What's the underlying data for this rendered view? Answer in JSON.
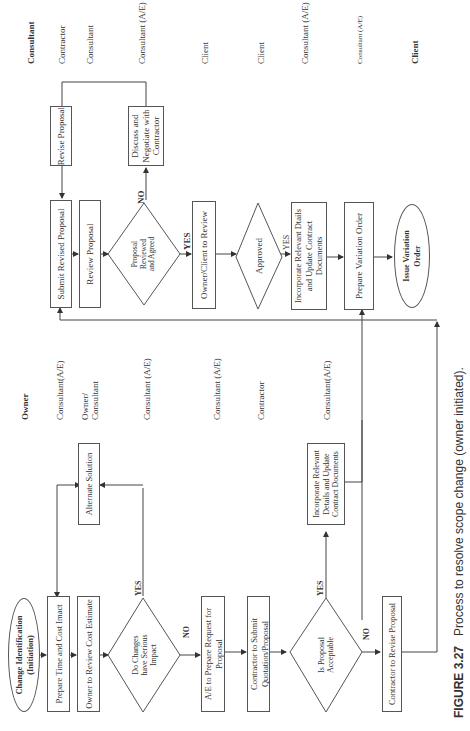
{
  "upper_flow": {
    "role_header": "Consultant",
    "roles": [
      "Contractor",
      "Consultant",
      "Consultant (A/E)",
      "Client",
      "Client",
      "Consultant (A/E)",
      "Consultant (A/E)",
      "Client"
    ],
    "steps": {
      "submit_revised": "Submit Revised Proposal",
      "revise_proposal": "Revise Proposal",
      "review_proposal": "Review Proposal",
      "decision_reviewed": [
        "Proposal",
        "Reviewed",
        "and Agreed"
      ],
      "discuss": [
        "Discuss and",
        "Negotiate with",
        "Contractor"
      ],
      "owner_review": "Owner/Client to Review",
      "approved": "Approved",
      "incorporate": [
        "Incorporate Relevant Dtails",
        "and Update Contract",
        "Documents"
      ],
      "prepare_vo": "Prepare Variation Order",
      "issue_vo": [
        "Issue Variation",
        "Order"
      ]
    },
    "labels": {
      "no": "NO",
      "yes1": "YES",
      "yes2": "YES"
    }
  },
  "lower_flow": {
    "role_header": "Owner",
    "roles": [
      "Consultant(A/E)",
      "Owner/ Consultant",
      "Consultant (A/E)",
      "Consultant (A/E)",
      "Contractor",
      "Consultant(A/E)"
    ],
    "steps": {
      "start": [
        "Change Identification",
        "(Initiation)"
      ],
      "time_cost": "Prepare Time and Cost Imact",
      "owner_review_cost": "Owner to Review Cost Estimate",
      "decision_serious": [
        "Do Changes",
        "have Serious",
        "Impact"
      ],
      "alternate": "Alternate Solution",
      "ae_prepare": [
        "A/E to Prepare Request for",
        "Proposal"
      ],
      "contractor_submit": [
        "Contractor to Submit",
        "Quotation/Proposal"
      ],
      "decision_acceptable": [
        "Is Proposal",
        "Acceptable"
      ],
      "incorporate": [
        "Incorporate Relevant",
        "Details and Update",
        "Contract Documents"
      ],
      "contractor_revise": "Contractor to Revise Proposal"
    },
    "labels": {
      "yes1": "YES",
      "no1": "NO",
      "yes2": "YES",
      "no2": "NO"
    }
  },
  "caption": {
    "figure": "FIGURE 3.27",
    "text": "Process to resolve scope change (owner initiated)."
  }
}
